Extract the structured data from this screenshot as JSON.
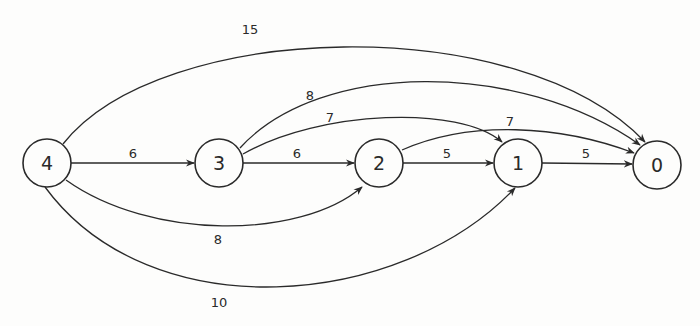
{
  "diagram": {
    "type": "directed-weighted-graph",
    "nodes": [
      {
        "id": "4",
        "label": "4",
        "cx": 47,
        "cy": 163
      },
      {
        "id": "3",
        "label": "3",
        "cx": 219,
        "cy": 163
      },
      {
        "id": "2",
        "label": "2",
        "cx": 379,
        "cy": 163
      },
      {
        "id": "1",
        "label": "1",
        "cx": 518,
        "cy": 163
      },
      {
        "id": "0",
        "label": "0",
        "cx": 657,
        "cy": 165
      }
    ],
    "edges": [
      {
        "from": "4",
        "to": "3",
        "weight": "6",
        "path": "M71,163 L194,163",
        "lx": 133,
        "ly": 153
      },
      {
        "from": "3",
        "to": "2",
        "weight": "6",
        "path": "M243,163 L354,163",
        "lx": 297,
        "ly": 153
      },
      {
        "from": "2",
        "to": "1",
        "weight": "5",
        "path": "M403,163 L493,163",
        "lx": 447,
        "ly": 153
      },
      {
        "from": "1",
        "to": "0",
        "weight": "5",
        "path": "M542,163 L632,164",
        "lx": 586,
        "ly": 153
      },
      {
        "from": "4",
        "to": "0",
        "weight": "15",
        "path": "M63,144 C160,20 520,10 645,142",
        "lx": 250,
        "ly": 29
      },
      {
        "from": "3",
        "to": "0",
        "weight": "8",
        "path": "M240,148 C320,60 520,60 640,145",
        "lx": 310,
        "ly": 95
      },
      {
        "from": "3",
        "to": "1",
        "weight": "7",
        "path": "M243,154 C320,110 460,105 502,142",
        "lx": 330,
        "ly": 117
      },
      {
        "from": "2",
        "to": "0",
        "weight": "7",
        "path": "M402,150 C470,120 560,125 634,153",
        "lx": 510,
        "ly": 121
      },
      {
        "from": "4",
        "to": "2",
        "weight": "8",
        "path": "M66,180 C150,240 300,240 362,187",
        "lx": 218,
        "ly": 239
      },
      {
        "from": "4",
        "to": "1",
        "weight": "10",
        "path": "M45,187 C150,330 400,310 515,188",
        "lx": 219,
        "ly": 302
      }
    ]
  }
}
